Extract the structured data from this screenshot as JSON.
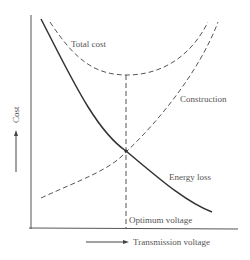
{
  "diagram": {
    "type": "cost-vs-voltage economic optimum",
    "axes": {
      "x_label": "Transmission voltage",
      "y_label": "Cost"
    },
    "curves": [
      {
        "name": "Total cost",
        "style": "dashed",
        "shape": "U-shaped, minimum at optimum voltage"
      },
      {
        "name": "Construction",
        "style": "dashed",
        "shape": "increasing with voltage"
      },
      {
        "name": "Energy loss",
        "style": "solid",
        "shape": "decreasing with voltage"
      }
    ],
    "labels": {
      "total_cost": "Total cost",
      "construction": "Construction",
      "energy_loss": "Energy loss",
      "optimum": "Optimum voltage"
    },
    "colors": {
      "line": "#333333",
      "text": "#555555",
      "background": "#ffffff"
    }
  }
}
